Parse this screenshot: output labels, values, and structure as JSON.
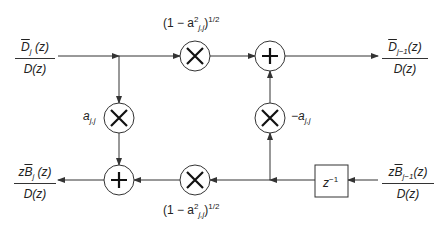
{
  "diagram": {
    "type": "lattice-filter-stage",
    "colors": {
      "line": "#333333",
      "background": "#ffffff"
    },
    "inputs": {
      "top_left": {
        "num_main": "D",
        "num_sub": "j",
        "num_arg": " (z)",
        "den": "D(z)"
      },
      "bottom_right": {
        "num_prefix": "z",
        "num_main": "B",
        "num_sub": "j−1",
        "num_arg": "(z)",
        "den": "D(z)"
      }
    },
    "outputs": {
      "top_right": {
        "num_main": "D",
        "num_sub": "j−1",
        "num_arg": "(z)",
        "den": "D(z)"
      },
      "bottom_left": {
        "num_prefix": "z",
        "num_main": "B",
        "num_sub": "j",
        "num_arg": " (z)",
        "den": "D(z)"
      }
    },
    "gains": {
      "top_multiplier": {
        "pre": "(1 − a",
        "sup": "2",
        "sub": "j,j",
        "post": ")",
        "exp": "1/2"
      },
      "bottom_multiplier": {
        "pre": "(1 − a",
        "sup": "2",
        "sub": "j,j",
        "post": ")",
        "exp": "1/2"
      },
      "left_multiplier": {
        "main": "a",
        "sub": "j,j"
      },
      "right_multiplier": {
        "main": "−a",
        "sub": "j,j"
      }
    },
    "delay": {
      "main": "z",
      "sup": "−1"
    },
    "nodes": [
      {
        "id": "mult-top",
        "symbol": "×"
      },
      {
        "id": "sum-top",
        "symbol": "+"
      },
      {
        "id": "mult-left",
        "symbol": "×"
      },
      {
        "id": "mult-right",
        "symbol": "×"
      },
      {
        "id": "sum-bottom",
        "symbol": "+"
      },
      {
        "id": "mult-bottom",
        "symbol": "×"
      },
      {
        "id": "delay-box",
        "symbol": "z^-1"
      }
    ]
  }
}
